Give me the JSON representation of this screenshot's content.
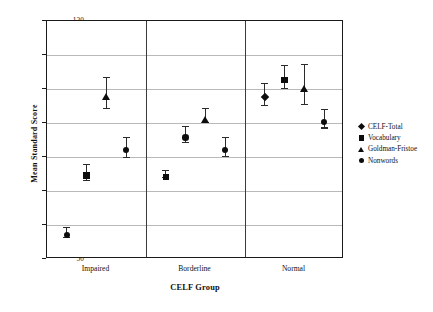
{
  "chart_data": {
    "type": "scatter",
    "title": "",
    "xlabel": "CELF Group",
    "ylabel": "Mean Standard Score",
    "ylim": [
      50,
      120
    ],
    "yticks": [
      50,
      60,
      70,
      80,
      90,
      100,
      110,
      120
    ],
    "categories": [
      "Impaired",
      "Borderline",
      "Normal"
    ],
    "grid": true,
    "legend_position": "right",
    "error_bars": "vertical ranges with caps",
    "series": [
      {
        "name": "CELF-Total",
        "marker": "diamond",
        "points": [
          {
            "category": "Impaired",
            "value": null,
            "low": null,
            "high": null
          },
          {
            "category": "Borderline",
            "value": null,
            "low": null,
            "high": null
          },
          {
            "category": "Normal",
            "value": 98.5,
            "low": 95.3,
            "high": 101.8
          }
        ]
      },
      {
        "name": "Vocabulary",
        "marker": "square",
        "points": [
          {
            "category": "Impaired",
            "value": 75.5,
            "low": 73.2,
            "high": 78.0
          },
          {
            "category": "Borderline",
            "value": 75.0,
            "low": 74.0,
            "high": 76.1
          },
          {
            "category": "Normal",
            "value": 103.6,
            "low": 100.2,
            "high": 107.0
          }
        ]
      },
      {
        "name": "Goldman-Fristoe",
        "marker": "triangle",
        "points": [
          {
            "category": "Impaired",
            "value": 98.8,
            "low": 94.4,
            "high": 103.5
          },
          {
            "category": "Borderline",
            "value": 92.2,
            "low": 90.2,
            "high": 94.5
          },
          {
            "category": "Normal",
            "value": 101.2,
            "low": 95.5,
            "high": 107.4
          }
        ]
      },
      {
        "name": "Nonwords",
        "marker": "circle",
        "points": [
          {
            "category": "Impaired",
            "value": 58.0,
            "low": 56.6,
            "high": 59.4
          },
          {
            "category": "Borderline",
            "value": 86.7,
            "low": 84.3,
            "high": 89.2
          },
          {
            "category": "Normal",
            "value": 91.2,
            "low": 88.7,
            "high": 94.0
          }
        ]
      }
    ],
    "plotted_points": [
      {
        "group": "Impaired",
        "slot": 0,
        "series": "Nonwords",
        "marker": "circle",
        "value": 58.0,
        "low": 56.6,
        "high": 59.4
      },
      {
        "group": "Impaired",
        "slot": 1,
        "series": "Vocabulary",
        "marker": "square",
        "value": 75.5,
        "low": 73.2,
        "high": 78.0
      },
      {
        "group": "Impaired",
        "slot": 2,
        "series": "Goldman-Fristoe",
        "marker": "triangle",
        "value": 98.8,
        "low": 94.4,
        "high": 103.5
      },
      {
        "group": "Impaired",
        "slot": 3,
        "series": "Nonwords",
        "marker": "circle",
        "value": 83.0,
        "low": 80.1,
        "high": 85.9
      },
      {
        "group": "Borderline",
        "slot": 0,
        "series": "Vocabulary",
        "marker": "square",
        "value": 75.0,
        "low": 74.0,
        "high": 76.1
      },
      {
        "group": "Borderline",
        "slot": 1,
        "series": "Nonwords",
        "marker": "circle",
        "value": 86.7,
        "low": 84.3,
        "high": 89.2
      },
      {
        "group": "Borderline",
        "slot": 2,
        "series": "Goldman-Fristoe",
        "marker": "triangle",
        "value": 92.2,
        "low": 90.2,
        "high": 94.5
      },
      {
        "group": "Borderline",
        "slot": 3,
        "series": "Nonwords",
        "marker": "circle",
        "value": 83.0,
        "low": 80.2,
        "high": 86.0
      },
      {
        "group": "Normal",
        "slot": 0,
        "series": "CELF-Total",
        "marker": "diamond",
        "value": 98.5,
        "low": 95.3,
        "high": 101.8
      },
      {
        "group": "Normal",
        "slot": 1,
        "series": "Vocabulary",
        "marker": "square",
        "value": 103.6,
        "low": 100.2,
        "high": 107.0
      },
      {
        "group": "Normal",
        "slot": 2,
        "series": "Goldman-Fristoe",
        "marker": "triangle",
        "value": 101.2,
        "low": 95.5,
        "high": 107.4
      },
      {
        "group": "Normal",
        "slot": 3,
        "series": "Nonwords",
        "marker": "circle",
        "value": 91.2,
        "low": 88.7,
        "high": 94.0
      }
    ]
  },
  "axes": {
    "y_title": "Mean Standard Score",
    "x_title": "CELF Group",
    "y_tick_labels": [
      "120",
      "110",
      "100",
      "90",
      "80",
      "70",
      "60",
      "50"
    ],
    "x_tick_labels": [
      "Impaired",
      "Borderline",
      "Normal"
    ]
  },
  "legend": {
    "items": [
      {
        "label": "CELF-Total",
        "marker": "diamond-marker-icon"
      },
      {
        "label": "Vocabulary",
        "marker": "square-marker-icon"
      },
      {
        "label": "Goldman-Fristoe",
        "marker": "triangle-marker-icon"
      },
      {
        "label": "Nonwords",
        "marker": "circle-marker-icon"
      }
    ]
  },
  "style": {
    "marker_color": "#0d0d0d",
    "grid_color": "#b9b9b9",
    "frame_color": "#1a1a1a",
    "background": "#ffffff"
  }
}
